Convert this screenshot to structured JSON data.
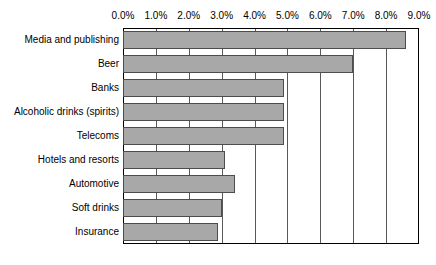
{
  "chart_data": {
    "type": "bar",
    "orientation": "horizontal",
    "title": "",
    "xlabel": "",
    "ylabel": "",
    "xlim": [
      0,
      9
    ],
    "xticks": [
      "0.0%",
      "1.0%",
      "2.0%",
      "3.0%",
      "4.0%",
      "5.0%",
      "6.0%",
      "7.0%",
      "8.0%",
      "9.0%"
    ],
    "xtick_values": [
      0,
      1,
      2,
      3,
      4,
      5,
      6,
      7,
      8,
      9
    ],
    "grid": true,
    "legend": "none",
    "categories": [
      "Media and publishing",
      "Beer",
      "Banks",
      "Alcoholic drinks (spirits)",
      "Telecoms",
      "Hotels and resorts",
      "Automotive",
      "Soft drinks",
      "Insurance"
    ],
    "values": [
      8.6,
      7.0,
      4.9,
      4.9,
      4.9,
      3.1,
      3.4,
      3.0,
      2.9
    ],
    "bar_color": "#a8a8a8",
    "bar_border_color": "#4d4d4d",
    "axis_color": "#000000",
    "background": "#ffffff"
  }
}
